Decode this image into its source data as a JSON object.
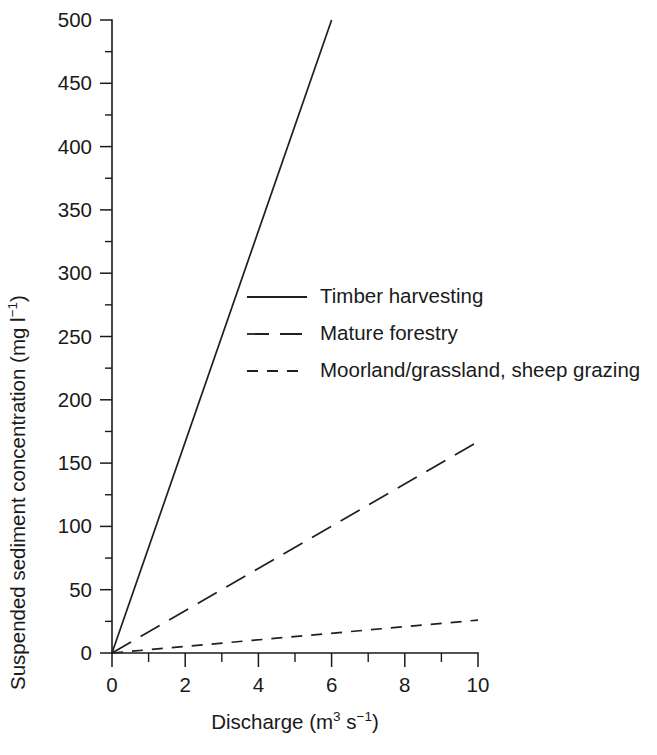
{
  "chart_data": {
    "type": "line",
    "title": "",
    "xlabel": "Discharge (m³ s⁻¹)",
    "ylabel": "Suspended sediment concentration (mg l⁻¹)",
    "xlim": [
      0,
      10
    ],
    "ylim": [
      0,
      500
    ],
    "grid": false,
    "legend_position": "inside-upper-middle",
    "x_major_ticks": [
      0,
      2,
      4,
      6,
      8,
      10
    ],
    "x_minor_ticks": [
      1,
      3,
      5,
      7,
      9
    ],
    "x_tick_labels": [
      "0",
      "2",
      "4",
      "6",
      "8",
      "10"
    ],
    "y_major_ticks": [
      0,
      50,
      100,
      150,
      200,
      250,
      300,
      350,
      400,
      450,
      500
    ],
    "y_minor_ticks": [
      25,
      75,
      125,
      175,
      225,
      275,
      325,
      375,
      425,
      475
    ],
    "y_tick_labels": [
      "0",
      "50",
      "100",
      "150",
      "200",
      "250",
      "300",
      "350",
      "400",
      "450",
      "500"
    ],
    "series": [
      {
        "name": "Timber harvesting",
        "style": "solid",
        "x": [
          0,
          6
        ],
        "values": [
          0,
          500
        ],
        "slope_mg_per_cumec": 83.3
      },
      {
        "name": "Mature forestry",
        "style": "long-dash",
        "x": [
          0,
          10
        ],
        "values": [
          0,
          167
        ],
        "slope_mg_per_cumec": 16.7
      },
      {
        "name": "Moorland/grassland, sheep grazing",
        "style": "short-dash",
        "x": [
          0,
          10
        ],
        "values": [
          0,
          26
        ],
        "slope_mg_per_cumec": 2.6
      }
    ],
    "legend_entries": [
      {
        "label": "Timber harvesting",
        "style": "solid"
      },
      {
        "label": "Mature forestry",
        "style": "long-dash"
      },
      {
        "label": "Moorland/grassland, sheep grazing",
        "style": "short-dash"
      }
    ],
    "axis_label_parts": {
      "x_base": "Discharge (m",
      "x_sup1": "3",
      "x_mid": " s",
      "x_sup2": "−1",
      "x_end": ")",
      "y_base": "Suspended sediment concentration (mg l",
      "y_sup": "−1",
      "y_end": ")"
    }
  },
  "colors": {
    "background": "#ffffff",
    "ink": "#1a1a1a",
    "series": "#1f1f1f"
  }
}
